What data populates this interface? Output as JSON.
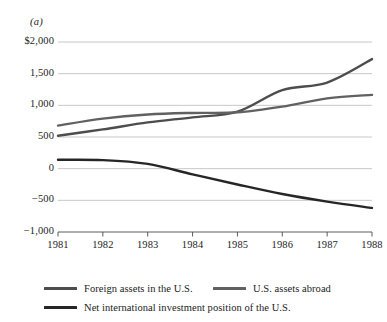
{
  "figure": {
    "panel_label": "(a)"
  },
  "chart_data": {
    "type": "line",
    "title": "",
    "subtitle": "",
    "xlabel": "",
    "ylabel": "",
    "grid": true,
    "legend_position": "bottom",
    "x": [
      1981,
      1982,
      1983,
      1984,
      1985,
      1986,
      1987,
      1988
    ],
    "xtick_labels": [
      "1981",
      "1982",
      "1983",
      "1984",
      "1985",
      "1986",
      "1987",
      "1988"
    ],
    "xlim": [
      1981,
      1988
    ],
    "ylim": [
      -1000,
      2000
    ],
    "yticks": [
      -1000,
      -500,
      0,
      500,
      1000,
      1500,
      2000
    ],
    "ytick_labels": [
      "−1,000",
      "−500",
      "0",
      "500",
      "1,000",
      "1,500",
      "$2,000"
    ],
    "units": "billions of dollars",
    "series": [
      {
        "name": "Foreign assets in the U.S.",
        "color": "#4d4d4d",
        "values": [
          520,
          620,
          730,
          810,
          900,
          1240,
          1360,
          1730
        ]
      },
      {
        "name": "U.S. assets abroad",
        "color": "#616161",
        "values": [
          680,
          790,
          855,
          880,
          890,
          980,
          1110,
          1165
        ]
      },
      {
        "name": "Net international investment position of the U.S.",
        "color": "#262626",
        "values": [
          140,
          135,
          75,
          -90,
          -250,
          -400,
          -520,
          -620
        ]
      }
    ]
  },
  "legend": {
    "items": [
      {
        "label": "Foreign assets in the U.S.",
        "color": "#4d4d4d"
      },
      {
        "label": "U.S. assets abroad",
        "color": "#616161"
      },
      {
        "label": "Net international investment position of the U.S.",
        "color": "#262626"
      }
    ]
  },
  "colors": {
    "gridline": "#b9b9b9",
    "axis": "#4a4a4a",
    "background": "#ffffff",
    "text": "#1a1a1a"
  }
}
